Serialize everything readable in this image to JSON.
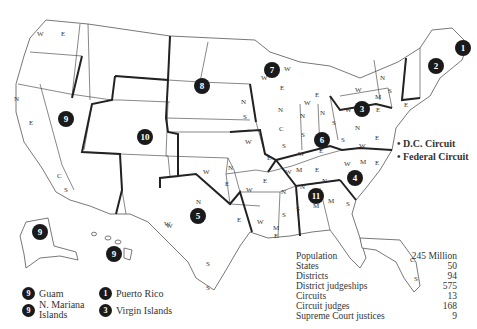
{
  "map": {
    "subject": "U.S. Federal Judicial Circuits and Districts",
    "circuit_badges": [
      {
        "id": "1",
        "x": 463,
        "y": 48
      },
      {
        "id": "2",
        "x": 436,
        "y": 66
      },
      {
        "id": "3",
        "x": 362,
        "y": 109
      },
      {
        "id": "4",
        "x": 355,
        "y": 178
      },
      {
        "id": "5",
        "x": 198,
        "y": 216
      },
      {
        "id": "6",
        "x": 322,
        "y": 140
      },
      {
        "id": "7",
        "x": 272,
        "y": 70
      },
      {
        "id": "8",
        "x": 202,
        "y": 86
      },
      {
        "id": "9",
        "x": 66,
        "y": 119
      },
      {
        "id": "10",
        "x": 145,
        "y": 137
      },
      {
        "id": "11",
        "x": 316,
        "y": 196
      },
      {
        "id": "9",
        "x": 40,
        "y": 232
      },
      {
        "id": "9",
        "x": 114,
        "y": 254
      }
    ],
    "district_labels": [
      {
        "t": "W",
        "x": 37,
        "y": 36
      },
      {
        "t": "E",
        "x": 61,
        "y": 36
      },
      {
        "t": "N",
        "x": 14,
        "y": 101
      },
      {
        "t": "E",
        "x": 29,
        "y": 125
      },
      {
        "t": "C",
        "x": 57,
        "y": 178
      },
      {
        "t": "S",
        "x": 64,
        "y": 192
      },
      {
        "t": "N",
        "x": 241,
        "y": 104
      },
      {
        "t": "S",
        "x": 243,
        "y": 119
      },
      {
        "t": "W",
        "x": 245,
        "y": 144
      },
      {
        "t": "E",
        "x": 267,
        "y": 160
      },
      {
        "t": "W",
        "x": 203,
        "y": 174
      },
      {
        "t": "N",
        "x": 228,
        "y": 170
      },
      {
        "t": "E",
        "x": 225,
        "y": 186
      },
      {
        "t": "W",
        "x": 246,
        "y": 192
      },
      {
        "t": "E",
        "x": 263,
        "y": 183
      },
      {
        "t": "N",
        "x": 196,
        "y": 204
      },
      {
        "t": "W",
        "x": 164,
        "y": 226
      },
      {
        "t": "E",
        "x": 237,
        "y": 222
      },
      {
        "t": "S",
        "x": 206,
        "y": 266
      },
      {
        "t": "W",
        "x": 257,
        "y": 224
      },
      {
        "t": "N",
        "x": 281,
        "y": 194
      },
      {
        "t": "S",
        "x": 282,
        "y": 217
      },
      {
        "t": "M",
        "x": 273,
        "y": 230
      },
      {
        "t": "E",
        "x": 274,
        "y": 238
      },
      {
        "t": "W",
        "x": 284,
        "y": 71
      },
      {
        "t": "E",
        "x": 280,
        "y": 90
      },
      {
        "t": "W",
        "x": 261,
        "y": 80
      },
      {
        "t": "N",
        "x": 278,
        "y": 112
      },
      {
        "t": "C",
        "x": 279,
        "y": 131
      },
      {
        "t": "S",
        "x": 282,
        "y": 148
      },
      {
        "t": "N",
        "x": 300,
        "y": 118
      },
      {
        "t": "S",
        "x": 301,
        "y": 137
      },
      {
        "t": "E",
        "x": 315,
        "y": 97
      },
      {
        "t": "W",
        "x": 304,
        "y": 105
      },
      {
        "t": "N",
        "x": 320,
        "y": 115
      },
      {
        "t": "S",
        "x": 332,
        "y": 125
      },
      {
        "t": "W",
        "x": 298,
        "y": 156
      },
      {
        "t": "E",
        "x": 319,
        "y": 153
      },
      {
        "t": "W",
        "x": 285,
        "y": 174
      },
      {
        "t": "M",
        "x": 296,
        "y": 172
      },
      {
        "t": "E",
        "x": 315,
        "y": 172
      },
      {
        "t": "N",
        "x": 300,
        "y": 189
      },
      {
        "t": "N",
        "x": 322,
        "y": 183
      },
      {
        "t": "S",
        "x": 296,
        "y": 211
      },
      {
        "t": "M",
        "x": 313,
        "y": 208
      },
      {
        "t": "M",
        "x": 328,
        "y": 203
      },
      {
        "t": "S",
        "x": 346,
        "y": 206
      },
      {
        "t": "N",
        "x": 355,
        "y": 130
      },
      {
        "t": "S",
        "x": 341,
        "y": 142
      },
      {
        "t": "W",
        "x": 359,
        "y": 148
      },
      {
        "t": "E",
        "x": 375,
        "y": 140
      },
      {
        "t": "W",
        "x": 344,
        "y": 166
      },
      {
        "t": "M",
        "x": 360,
        "y": 164
      },
      {
        "t": "E",
        "x": 375,
        "y": 165
      },
      {
        "t": "W",
        "x": 345,
        "y": 112
      },
      {
        "t": "M",
        "x": 375,
        "y": 99
      },
      {
        "t": "E",
        "x": 376,
        "y": 112
      },
      {
        "t": "W",
        "x": 355,
        "y": 92
      },
      {
        "t": "N",
        "x": 380,
        "y": 80
      },
      {
        "t": "S",
        "x": 388,
        "y": 93
      },
      {
        "t": "E",
        "x": 404,
        "y": 107
      },
      {
        "t": "C",
        "x": 410,
        "y": 262
      },
      {
        "t": "S",
        "x": 414,
        "y": 281
      },
      {
        "t": "S",
        "x": 206,
        "y": 290
      },
      {
        "t": "W",
        "x": 166,
        "y": 228
      }
    ]
  },
  "annotations": {
    "dc_circuit": "• D.C. Circuit",
    "federal_circuit": "• Federal Circuit"
  },
  "legend": [
    {
      "badge": "9",
      "label": "Guam"
    },
    {
      "badge": "9",
      "label": "N. Mariana Islands"
    },
    {
      "badge": "1",
      "label": "Puerto Rico"
    },
    {
      "badge": "3",
      "label": "Virgin Islands"
    }
  ],
  "stats": [
    {
      "label": "Population",
      "value": "245 Million"
    },
    {
      "label": "States",
      "value": "50"
    },
    {
      "label": "Districts",
      "value": "94"
    },
    {
      "label": "District judgeships",
      "value": "575"
    },
    {
      "label": "Circuits",
      "value": "13"
    },
    {
      "label": "Circuit judges",
      "value": "168"
    },
    {
      "label": "Supreme Court justices",
      "value": "9"
    }
  ]
}
